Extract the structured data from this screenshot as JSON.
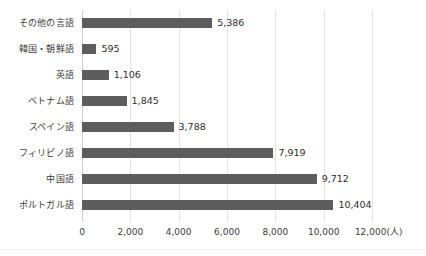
{
  "chart_data": {
    "type": "bar",
    "orientation": "horizontal",
    "title": "",
    "xlabel": "",
    "ylabel": "",
    "unit_label": "(人)",
    "xlim": [
      0,
      12000
    ],
    "xticks": [
      0,
      2000,
      4000,
      6000,
      8000,
      10000,
      12000
    ],
    "xtick_labels": [
      "0",
      "2,000",
      "4,000",
      "6,000",
      "8,000",
      "10,000",
      "12,000"
    ],
    "grid": true,
    "legend": false,
    "bar_color": "#5d5d5d",
    "gridline_color": "#e3e3e3",
    "categories": [
      "その他の言語",
      "韓国・朝鮮語",
      "英語",
      "ベトナム語",
      "スペイン語",
      "フィリピノ語",
      "中国語",
      "ポルトガル語"
    ],
    "values": [
      5386,
      595,
      1106,
      1845,
      3788,
      7919,
      9712,
      10404
    ],
    "value_labels": [
      "5,386",
      "595",
      "1,106",
      "1,845",
      "3,788",
      "7,919",
      "9,712",
      "10,404"
    ]
  }
}
